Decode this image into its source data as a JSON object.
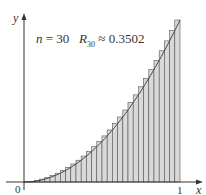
{
  "chart_data": {
    "type": "bar",
    "title": "",
    "function": "y = x^2",
    "method": "right endpoint Riemann sum",
    "n": 30,
    "annotation": {
      "n_label": "n = 30",
      "r_name": "R",
      "r_sub": "30",
      "approx": "≈ 0.3502"
    },
    "xlabel": "x",
    "ylabel": "y",
    "x_ticks": [
      "0",
      "1"
    ],
    "xlim": [
      0,
      1
    ],
    "ylim": [
      0,
      1
    ],
    "categories_rule": "x_i = i/30, i = 1..30",
    "values": [
      0.0011,
      0.0044,
      0.01,
      0.0178,
      0.0278,
      0.04,
      0.0544,
      0.0711,
      0.09,
      0.1111,
      0.1344,
      0.16,
      0.1878,
      0.2178,
      0.25,
      0.2844,
      0.3211,
      0.36,
      0.4011,
      0.4444,
      0.49,
      0.5378,
      0.5878,
      0.64,
      0.6944,
      0.7511,
      0.81,
      0.8711,
      0.9344,
      1.0
    ],
    "grid": false,
    "legend": "none",
    "colors": {
      "bar_fill": "#d9d9d9",
      "bar_stroke": "#555555",
      "curve": "#444444",
      "axis": "#333333"
    }
  }
}
